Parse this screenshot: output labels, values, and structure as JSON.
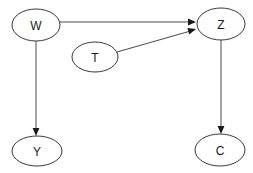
{
  "diagram": {
    "type": "directed-acyclic-graph",
    "title": "",
    "background_color": "#ffffff",
    "node_stroke_color": "#3a3a3a",
    "edge_color": "#4a4a4a",
    "label_color": "#1a1a1a",
    "nodes": [
      {
        "id": "W",
        "label": "W",
        "cx": 36,
        "cy": 25,
        "rx": 24,
        "ry": 16
      },
      {
        "id": "Z",
        "label": "Z",
        "cx": 221,
        "cy": 24,
        "rx": 24,
        "ry": 16
      },
      {
        "id": "T",
        "label": "T",
        "cx": 95,
        "cy": 57,
        "rx": 23,
        "ry": 15
      },
      {
        "id": "Y",
        "label": "Y",
        "cx": 37,
        "cy": 151,
        "rx": 25,
        "ry": 15
      },
      {
        "id": "C",
        "label": "C",
        "cx": 220,
        "cy": 150,
        "rx": 25,
        "ry": 16
      }
    ],
    "edges": [
      {
        "id": "w-z",
        "from": "W",
        "to": "Z",
        "from_label": "W",
        "to_label": "Z",
        "path": "M 60 22 L 194 22",
        "head_x": 196,
        "head_y": 22,
        "head_angle": 0
      },
      {
        "id": "t-z",
        "from": "T",
        "to": "Z",
        "from_label": "T",
        "to_label": "Z",
        "path": "M 117 52 L 194 30",
        "head_x": 196,
        "head_y": 29,
        "head_angle": -16
      },
      {
        "id": "w-y",
        "from": "W",
        "to": "Y",
        "from_label": "W",
        "to_label": "Y",
        "path": "M 36 41 L 36 133",
        "head_x": 36,
        "head_y": 136,
        "head_angle": 90
      },
      {
        "id": "z-c",
        "from": "Z",
        "to": "C",
        "from_label": "Z",
        "to_label": "C",
        "path": "M 221 40 L 221 131",
        "head_x": 221,
        "head_y": 134,
        "head_angle": 90
      }
    ]
  }
}
